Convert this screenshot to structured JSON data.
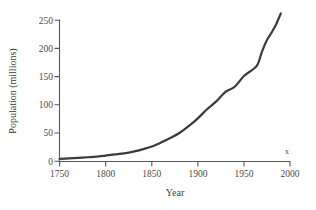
{
  "chart_data": {
    "type": "line",
    "title": "",
    "xlabel": "Year",
    "ylabel": "Population (millions)",
    "xlim": [
      1750,
      2000
    ],
    "ylim": [
      0,
      250
    ],
    "grid": false,
    "legend": null,
    "x_ticks": [
      "1750",
      "1800",
      "1850",
      "1900",
      "1950",
      "2000"
    ],
    "x_tick_values": [
      1750,
      1800,
      1850,
      1900,
      1950,
      2000
    ],
    "y_ticks": [
      "0",
      "50",
      "100",
      "150",
      "200",
      "250"
    ],
    "y_tick_values": [
      0,
      50,
      100,
      150,
      200,
      250
    ],
    "annotations": [
      {
        "text": "x",
        "x": 1987,
        "y": 12
      }
    ],
    "series": [
      {
        "name": "Population",
        "color": "#3b3b3b",
        "x": [
          1750,
          1760,
          1770,
          1780,
          1790,
          1800,
          1810,
          1820,
          1830,
          1840,
          1850,
          1860,
          1870,
          1880,
          1890,
          1900,
          1910,
          1920,
          1930,
          1940,
          1950,
          1960,
          1965,
          1970,
          1975,
          1980,
          1985,
          1990
        ],
        "values": [
          4,
          5,
          6,
          7,
          8,
          10,
          12,
          14,
          17,
          21,
          26,
          33,
          41,
          50,
          62,
          76,
          92,
          106,
          123,
          132,
          151,
          163,
          172,
          196,
          215,
          228,
          243,
          262
        ]
      }
    ]
  },
  "axis_styles": {
    "axis_color": "#585858",
    "text_color": "#3b3b3b",
    "background": "#ffffff"
  }
}
